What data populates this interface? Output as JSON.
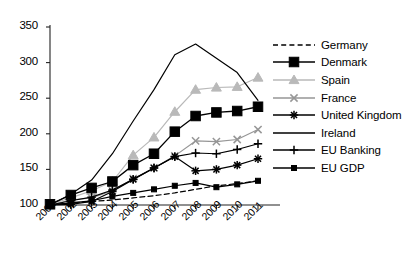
{
  "chart_data": {
    "type": "line",
    "title": "",
    "xlabel": "",
    "ylabel": "",
    "x": [
      2001,
      2002,
      2003,
      2004,
      2005,
      2006,
      2007,
      2008,
      2009,
      2010,
      2011
    ],
    "xticklabels": [
      "2001",
      "2002",
      "2003",
      "2004",
      "2005",
      "2006",
      "2007",
      "2008",
      "2009",
      "2010",
      "2011"
    ],
    "yticks": [
      100,
      150,
      200,
      250,
      300,
      350
    ],
    "ylim": [
      100,
      350
    ],
    "xlim": [
      2001,
      2011
    ],
    "grid": false,
    "legend_position": "right",
    "series": [
      {
        "name": "Germany",
        "color": "#000000",
        "dash": "dashed",
        "marker": "none",
        "values": [
          100,
          103,
          105,
          107,
          110,
          113,
          117,
          122,
          127,
          130,
          134
        ]
      },
      {
        "name": "Denmark",
        "color": "#000000",
        "dash": "solid",
        "marker": "square-large",
        "values": [
          101,
          114,
          124,
          133,
          156,
          172,
          203,
          225,
          230,
          232,
          238
        ]
      },
      {
        "name": "Spain",
        "color": "#b9b9b9",
        "dash": "solid",
        "marker": "triangle",
        "values": [
          101,
          110,
          120,
          133,
          170,
          195,
          231,
          262,
          265,
          266,
          279
        ]
      },
      {
        "name": "France",
        "color": "#969696",
        "dash": "solid",
        "marker": "x",
        "values": [
          100,
          107,
          110,
          120,
          137,
          152,
          169,
          190,
          189,
          192,
          206
        ]
      },
      {
        "name": "United Kingdom",
        "color": "#000000",
        "dash": "solid",
        "marker": "asterisk",
        "values": [
          100,
          101,
          105,
          119,
          136,
          152,
          168,
          148,
          150,
          156,
          165
        ]
      },
      {
        "name": "Ireland",
        "color": "#000000",
        "dash": "solid",
        "marker": "none",
        "values": [
          100,
          115,
          135,
          172,
          218,
          262,
          311,
          326,
          306,
          286,
          247
        ]
      },
      {
        "name": "EU Banking",
        "color": "#000000",
        "dash": "solid",
        "marker": "plus",
        "values": [
          100,
          106,
          111,
          121,
          136,
          152,
          168,
          173,
          172,
          178,
          186
        ]
      },
      {
        "name": "EU GDP",
        "color": "#000000",
        "dash": "solid",
        "marker": "square-small",
        "values": [
          100,
          103,
          106,
          112,
          117,
          122,
          127,
          131,
          125,
          129,
          134
        ]
      }
    ]
  },
  "axes": {
    "y_tick_labels": [
      "350",
      "300",
      "250",
      "200",
      "150",
      "100"
    ]
  },
  "legend": {
    "items": [
      {
        "label": "Germany"
      },
      {
        "label": "Denmark"
      },
      {
        "label": "Spain"
      },
      {
        "label": "France"
      },
      {
        "label": "United Kingdom"
      },
      {
        "label": "Ireland"
      },
      {
        "label": "EU Banking"
      },
      {
        "label": "EU GDP"
      }
    ]
  }
}
